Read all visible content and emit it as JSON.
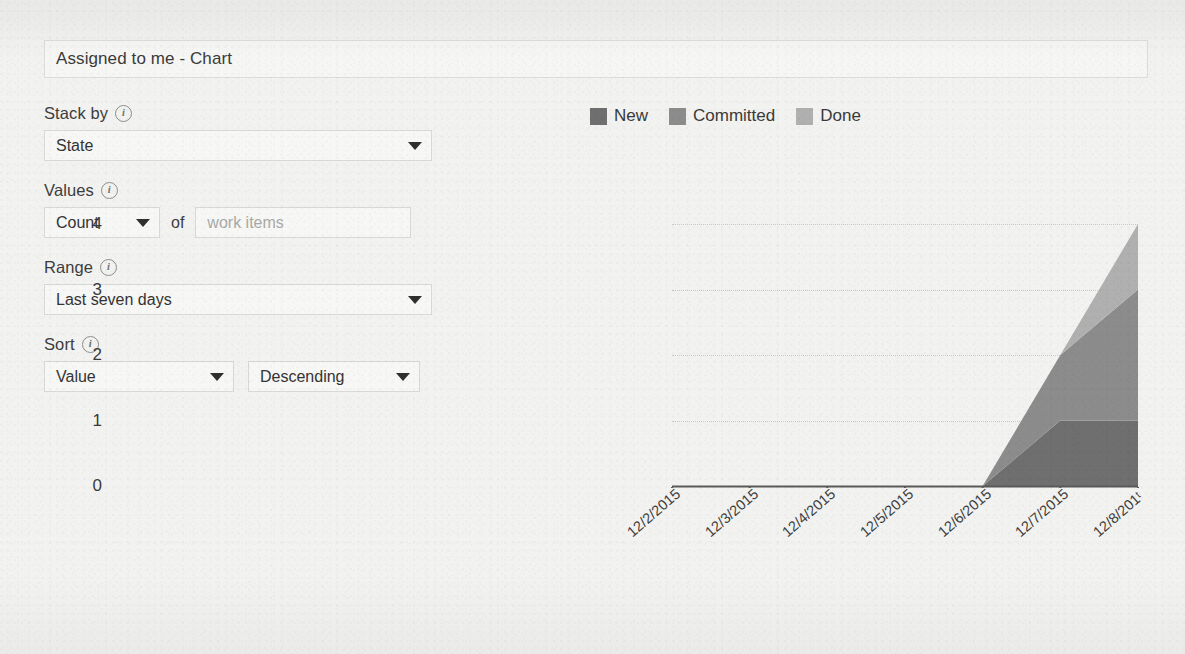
{
  "title_field": {
    "name": "chart-title",
    "value": "Assigned to me - Chart"
  },
  "config": {
    "stack_by": {
      "label": "Stack by",
      "info_glyph": "i",
      "value": "State"
    },
    "values": {
      "label": "Values",
      "info_glyph": "i",
      "aggregation": "Count",
      "of_text": "of",
      "field_placeholder": "work items"
    },
    "range": {
      "label": "Range",
      "info_glyph": "i",
      "value": "Last seven days"
    },
    "sort": {
      "label": "Sort",
      "info_glyph": "i",
      "by_value": "Value",
      "direction_value": "Descending"
    }
  },
  "colors": {
    "new": "#6f6f6f",
    "committed": "#8c8c8c",
    "done": "#b0b0b0",
    "axis": "#5a5a5a",
    "gridline": "#c9c9c7",
    "panel_border": "#d8d8d6",
    "background": "#f2f2f0"
  },
  "chart_data": {
    "type": "area",
    "stacked": true,
    "title": "",
    "xlabel": "",
    "ylabel": "",
    "grid": true,
    "grid_style": "dotted-horizontal",
    "legend_position": "top",
    "ylim": [
      0,
      4
    ],
    "yticks": [
      "0",
      "1",
      "2",
      "3",
      "4"
    ],
    "categories": [
      "12/2/2015",
      "12/3/2015",
      "12/4/2015",
      "12/5/2015",
      "12/6/2015",
      "12/7/2015",
      "12/8/2015"
    ],
    "xtick_labels_displayed": [
      "12/2/2015",
      "12/3/2015",
      "12/4/2015",
      "12/5/2015",
      "12/6/2015",
      "12/7/2015",
      "12/8/201ᵗ"
    ],
    "xtick_rotation_deg": -41,
    "series": [
      {
        "name": "New",
        "color": "#6f6f6f",
        "values": [
          0,
          0,
          0,
          0,
          0,
          1,
          1
        ]
      },
      {
        "name": "Committed",
        "color": "#8c8c8c",
        "values": [
          0,
          0,
          0,
          0,
          0,
          1,
          2
        ]
      },
      {
        "name": "Done",
        "color": "#b0b0b0",
        "values": [
          0,
          0,
          0,
          0,
          0,
          0,
          1
        ]
      }
    ],
    "totals": [
      0,
      0,
      0,
      0,
      0,
      2,
      4
    ]
  }
}
